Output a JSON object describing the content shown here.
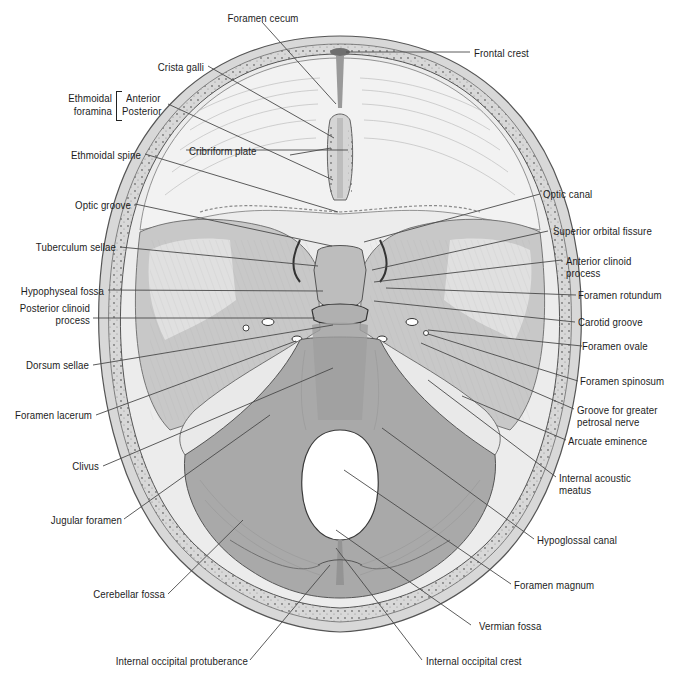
{
  "figure": {
    "colors": {
      "background": "#ffffff",
      "bone_light": "#e4e4e4",
      "bone_mid": "#b9b9b9",
      "bone_dark": "#8f8f8f",
      "diploe": "#d2d2d2",
      "label_text": "#1c1c1c",
      "leader_line": "#4a4a4a"
    }
  },
  "labels": {
    "foramen_cecum": "Foramen cecum",
    "frontal_crest": "Frontal crest",
    "crista_galli": "Crista galli",
    "ethmoidal_foramina_line1": "Ethmoidal",
    "ethmoidal_foramina_line2": "foramina",
    "anterior": "Anterior",
    "posterior": "Posterior",
    "ethmoidal_spine": "Ethmoidal spine",
    "cribriform_plate": "Cribriform plate",
    "optic_canal": "Optic canal",
    "optic_groove": "Optic groove",
    "superior_orbital_fissure": "Superior orbital fissure",
    "tuberculum_sellae": "Tuberculum sellae",
    "anterior_clinoid_line1": "Anterior clinoid",
    "anterior_clinoid_line2": "process",
    "hypophyseal_fossa": "Hypophyseal fossa",
    "foramen_rotundum": "Foramen rotundum",
    "posterior_clinoid_line1": "Posterior clinoid",
    "posterior_clinoid_line2": "process",
    "carotid_groove": "Carotid groove",
    "foramen_ovale": "Foramen ovale",
    "dorsum_sellae": "Dorsum sellae",
    "foramen_spinosum": "Foramen spinosum",
    "foramen_lacerum": "Foramen lacerum",
    "groove_petrosal_line1": "Groove for greater",
    "groove_petrosal_line2": "petrosal nerve",
    "arcuate_eminence": "Arcuate eminence",
    "clivus": "Clivus",
    "internal_acoustic_line1": "Internal acoustic",
    "internal_acoustic_line2": "meatus",
    "jugular_foramen": "Jugular foramen",
    "hypoglossal_canal": "Hypoglossal canal",
    "cerebellar_fossa": "Cerebellar fossa",
    "foramen_magnum": "Foramen magnum",
    "vermian_fossa": "Vermian fossa",
    "internal_occipital_protuberance": "Internal occipital protuberance",
    "internal_occipital_crest": "Internal occipital crest"
  }
}
